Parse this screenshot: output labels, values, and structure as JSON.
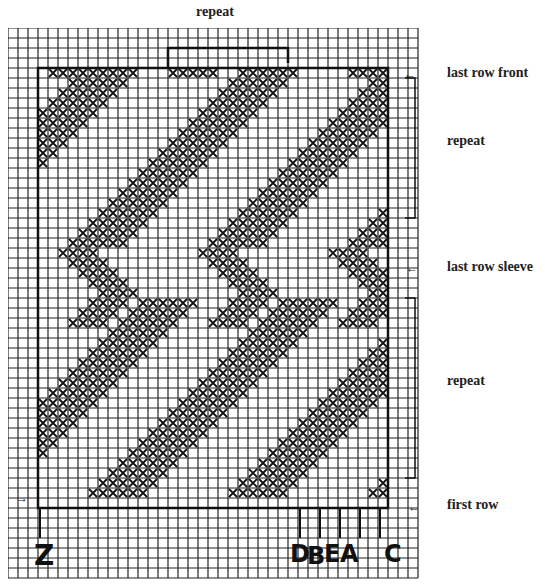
{
  "title_top": "repeat",
  "labels": {
    "last_row_front": "last row front",
    "repeat_upper": "repeat",
    "last_row_sleeve": "last row sleeve",
    "repeat_lower": "repeat",
    "first_row": "first row"
  },
  "column_markers": [
    "Z",
    "D",
    "B",
    "E",
    "A",
    "C"
  ],
  "arrow_glyph": "←",
  "arrow_glyph_right": "→",
  "colors": {
    "ink": "#111111",
    "paper": "#ffffff",
    "gridline": "#222222"
  },
  "grid": {
    "cell": 10,
    "cols": 41,
    "rows": 55,
    "box": {
      "col0": 3,
      "row0": 4,
      "col1": 38,
      "row1": 48
    },
    "top_bracket": {
      "col0": 16,
      "col1": 28,
      "row": 2
    },
    "right_bracket_upper": {
      "col": 42,
      "row0": 5,
      "row1": 19
    },
    "right_bracket_lower": {
      "col": 42,
      "row0": 27,
      "row1": 45
    }
  },
  "chart_data": {
    "type": "heatmap",
    "cell_state": [
      "empty",
      "stitched (X)"
    ],
    "bands": [
      {
        "section": "upper",
        "row_from": 4,
        "row_to": 22,
        "starts": [
          -14,
          2,
          16,
          30
        ],
        "width": 6,
        "slope": 1
      },
      {
        "section": "lower",
        "row_from": 27,
        "row_to": 47,
        "starts": [
          -10,
          4,
          18,
          32
        ],
        "width": 6,
        "slope": 1
      }
    ],
    "chevrons": {
      "row_from": 22,
      "row_to": 30,
      "centers": [
        6,
        20,
        33
      ]
    },
    "annotations": [
      "last row front",
      "repeat",
      "last row sleeve",
      "repeat",
      "first row"
    ],
    "column_labels": [
      "Z",
      "D",
      "B",
      "E",
      "A",
      "C"
    ]
  }
}
